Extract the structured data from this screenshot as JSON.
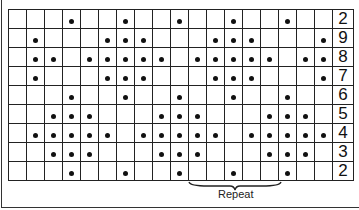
{
  "chart": {
    "title": "",
    "columns": 18,
    "rows": [
      {
        "label": "2",
        "dots": [
          4,
          7,
          10,
          13,
          16
        ]
      },
      {
        "label": "9",
        "dots": [
          2,
          6,
          7,
          8,
          12,
          13,
          14,
          18
        ]
      },
      {
        "label": "8",
        "dots": [
          2,
          3,
          5,
          6,
          7,
          8,
          9,
          11,
          12,
          13,
          14,
          15,
          17,
          18
        ]
      },
      {
        "label": "7",
        "dots": [
          2,
          6,
          7,
          8,
          12,
          13,
          14,
          18
        ]
      },
      {
        "label": "6",
        "dots": [
          4,
          7,
          10,
          13,
          16
        ]
      },
      {
        "label": "5",
        "dots": [
          3,
          4,
          5,
          9,
          10,
          11,
          15,
          16,
          17
        ]
      },
      {
        "label": "4",
        "dots": [
          2,
          3,
          4,
          5,
          6,
          8,
          9,
          10,
          11,
          12,
          14,
          15,
          16,
          17,
          18
        ]
      },
      {
        "label": "3",
        "dots": [
          3,
          4,
          5,
          9,
          10,
          11,
          15,
          16,
          17
        ]
      },
      {
        "label": "2",
        "dots": [
          4,
          7,
          10,
          13,
          16
        ]
      }
    ],
    "repeat_label": "Repeat",
    "repeat_span": {
      "start_col": 11,
      "end_col": 15
    }
  }
}
